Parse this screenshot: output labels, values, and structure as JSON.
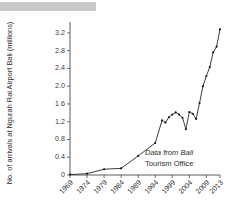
{
  "page": {
    "top_bar_color": "#c9c9c9",
    "background_color": "#ffffff"
  },
  "chart_data": {
    "type": "line",
    "title": "",
    "subtitle": "",
    "xlabel": "",
    "ylabel": "No. of arrivals at Ngurah Rai Airport Bali (millions)",
    "xlim": [
      1969,
      2013
    ],
    "ylim": [
      0,
      3.4
    ],
    "grid": false,
    "legend": null,
    "line_color": "#1b1b1b",
    "marker": "dot",
    "ytick_labels": [
      "0",
      "0.4",
      "0.8",
      "1.2",
      "1.6",
      "2.0",
      "2.4",
      "2.8",
      "3.2"
    ],
    "ytick_values": [
      0,
      0.4,
      0.8,
      1.2,
      1.6,
      2.0,
      2.4,
      2.8,
      3.2
    ],
    "xtick_labels": [
      "1969",
      "1974",
      "1979",
      "1984",
      "1989",
      "1994",
      "1999",
      "2004",
      "2009",
      "2013"
    ],
    "xtick_values": [
      1969,
      1974,
      1979,
      1984,
      1989,
      1994,
      1999,
      2004,
      2009,
      2013
    ],
    "annotations": [
      {
        "name": "source-note-line1",
        "text": "Data from Bali",
        "style": "italic"
      },
      {
        "name": "source-note-line2",
        "text": "Tourism Office",
        "style": "normal"
      }
    ],
    "x": [
      1969,
      1974,
      1979,
      1984,
      1989,
      1994,
      1996,
      1997,
      1998,
      1999,
      2000,
      2001,
      2002,
      2003,
      2004,
      2005,
      2006,
      2007,
      2008,
      2009,
      2010,
      2011,
      2012,
      2013
    ],
    "values": [
      0.01,
      0.03,
      0.13,
      0.15,
      0.43,
      0.72,
      1.23,
      1.18,
      1.3,
      1.36,
      1.41,
      1.36,
      1.29,
      1.03,
      1.42,
      1.38,
      1.26,
      1.62,
      2.0,
      2.23,
      2.43,
      2.76,
      2.89,
      3.28
    ]
  }
}
